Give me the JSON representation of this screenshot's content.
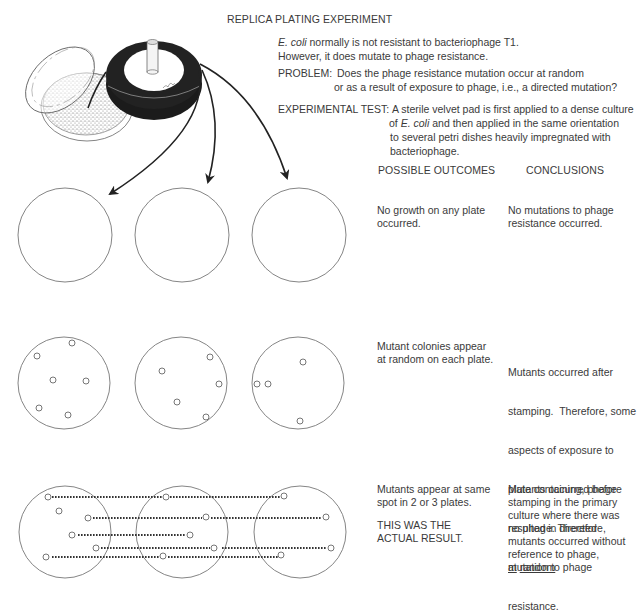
{
  "title": "REPLICA PLATING EXPERIMENT",
  "intro": {
    "line1_italic": "E. coli",
    "line1_rest": " normally is not resistant to bacteriophage T1.",
    "line2": "However, it does mutate to phage resistance."
  },
  "problem": {
    "label": "PROBLEM:",
    "line1": "Does the phage resistance mutation occur at random",
    "line2": "or as a result of exposure to phage, i.e., a directed mutation?"
  },
  "experimental_test": {
    "label": "EXPERIMENTAL TEST:",
    "line1": "A sterile velvet pad is first applied to a dense culture",
    "line2_pre": "of ",
    "line2_italic": "E. coli",
    "line2_post": " and then applied in the same orientation",
    "line3": "to several petri dishes heavily impregnated with",
    "line4": "bacteriophage."
  },
  "columns": {
    "outcomes_header": "POSSIBLE OUTCOMES",
    "conclusions_header": "CONCLUSIONS"
  },
  "rows": [
    {
      "outcome": [
        "No growth on any plate",
        "occurred."
      ],
      "conclusion": [
        "No mutations to phage",
        "resistance occurred."
      ]
    },
    {
      "outcome": [
        "Mutant colonies appear",
        "at random on each plate."
      ],
      "conclusion": [
        "Mutants occurred after",
        "stamping.  Therefore, some",
        "aspects of exposure to",
        "plate containing, phage",
        "resulted in directed",
        "mutation to phage",
        "resistance."
      ]
    },
    {
      "outcome": [
        "Mutants appear at same",
        "spot in 2 or 3 plates."
      ],
      "note": [
        "THIS WAS THE",
        "ACTUAL RESULT."
      ],
      "conclusion": [
        "Mutants occurred before",
        "stamping in the primary",
        "culture where there was",
        "no phage. Therefore,",
        "mutants occurred without",
        "reference to phage,"
      ],
      "conclusion_underlined": [
        "at",
        "random"
      ]
    }
  ],
  "figure": {
    "icons": [
      "petri-dish-lid",
      "culture-plate",
      "velvet-pad-stamp",
      "arrow-icon"
    ],
    "stroke_color": "#555555",
    "fill_dark": "#1a1a1a"
  }
}
